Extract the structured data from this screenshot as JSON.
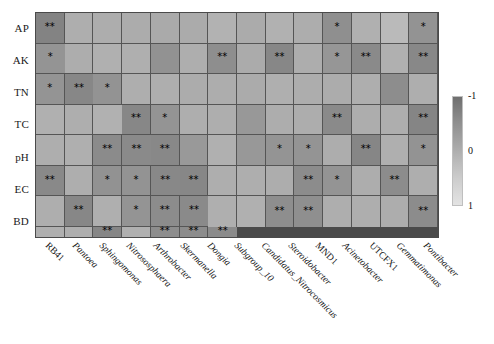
{
  "chart_data": {
    "type": "heatmap",
    "title": "",
    "xlabel": "",
    "ylabel": "",
    "legend_position": "right",
    "grid": true,
    "colorbar": {
      "name": "correlation-colorbar",
      "ticks": [
        "-1",
        "0",
        "1"
      ],
      "tick_values": [
        -1,
        0,
        1
      ],
      "vmin": -1,
      "vmax": 1,
      "colormap": "grayscale",
      "color_high": "#6f6f6f",
      "color_low": "#e3e3e3",
      "orientation": "vertical"
    },
    "significance_legend": {
      "one_star": "*",
      "two_star": "**"
    },
    "y_categories": [
      "AP",
      "AK",
      "TN",
      "TC",
      "pH",
      "EC",
      "BD"
    ],
    "x_categories": [
      "RB41",
      "Pantoea",
      "Sphingomonas",
      "Nitrososphaera",
      "Arthrobacter",
      "Skermanella",
      "Dongia",
      "Subgroup_10",
      "Candidatus_Nitrocosmicus",
      "Steroidobacter",
      "MND1",
      "Acinetobacter",
      "UTCFX1",
      "Gemmatimonas",
      "Pontibacter"
    ],
    "x_categories_used": [
      "RB41",
      "Pantoea",
      "Sphingomonas",
      "Nitrososphaera",
      "Arthrobacter",
      "Skermanella",
      "Dongia",
      "Subgroup_10",
      "Candidatus_Nitrocosmicus",
      "Steroidobacter",
      "MND1",
      "Acinetobacter",
      "UTCFX1",
      "Gemmatimonas",
      "Pontibacter"
    ],
    "rows": [
      {
        "label": "AP",
        "values": [
          -0.58,
          0.12,
          0.1,
          0.08,
          0.05,
          0.07,
          0.18,
          0.06,
          0.16,
          0.1,
          -0.38,
          0.14,
          0.3,
          -0.33,
          -0.3
        ],
        "stars": [
          "**",
          "",
          "",
          "",
          "",
          "",
          "",
          "",
          "",
          "",
          "*",
          "",
          "",
          "*",
          "*"
        ]
      },
      {
        "label": "AK",
        "values": [
          0.1,
          0.14,
          0.13,
          -0.34,
          0.12,
          -0.4,
          0.07,
          -0.52,
          0.1,
          -0.28,
          -0.47,
          0.15,
          -0.5,
          -0.31,
          -0.52
        ],
        "stars": [
          "",
          "",
          "",
          "",
          "",
          "**",
          "",
          "**",
          "",
          "*",
          "**",
          "",
          "**",
          "*",
          "**"
        ]
      },
      {
        "label": "TN",
        "values": [
          -0.33,
          0.12,
          0.11,
          0.08,
          0.1,
          0.06,
          0.13,
          0.09,
          0.08,
          0.12,
          -0.42,
          0.11,
          0.14,
          0.12,
          0.16
        ],
        "stars": [
          "*",
          "",
          "",
          "",
          "",
          "",
          "",
          "",
          "",
          "",
          "",
          "",
          "",
          "",
          ""
        ]
      },
      {
        "label": "TC",
        "values": [
          -0.52,
          -0.3,
          0.12,
          0.11,
          -0.25,
          0.09,
          0.1,
          -0.46,
          0.1,
          0.12,
          -0.55,
          0.11,
          0.13,
          -0.45,
          -0.47
        ],
        "stars": [
          "**",
          "*",
          "",
          "",
          "",
          "",
          "",
          "**",
          "",
          "",
          "**",
          "",
          "",
          "**",
          "**"
        ]
      },
      {
        "label": "pH",
        "values": [
          -0.5,
          -0.22,
          0.14,
          -0.24,
          -0.3,
          -0.31,
          0.1,
          -0.54,
          0.13,
          -0.33,
          -0.49,
          0.12,
          -0.34,
          -0.32,
          -0.5
        ],
        "stars": [
          "**",
          "",
          "",
          "",
          "*",
          "*",
          "",
          "**",
          "",
          "*",
          "**",
          "",
          "*",
          "*",
          "**"
        ]
      },
      {
        "label": "EC",
        "values": [
          -0.51,
          0.11,
          0.12,
          0.1,
          -0.44,
          -0.31,
          0.1,
          -0.43,
          0.12,
          0.12,
          -0.52,
          0.13,
          -0.3,
          -0.43,
          -0.46
        ],
        "stars": [
          "**",
          "",
          "",
          "",
          "**",
          "*",
          "",
          "**",
          "",
          "",
          "**",
          "",
          "*",
          "**",
          "**"
        ]
      },
      {
        "label": "BD",
        "values": [
          0.13,
          0.14,
          -0.41,
          -0.38,
          0.11,
          0.12,
          0.1,
          -0.44,
          0.13,
          0.11,
          -0.53,
          0.15,
          -0.42,
          -0.43,
          -0.45
        ],
        "stars": [
          "",
          "",
          "**",
          "**",
          "",
          "",
          "",
          "**",
          "",
          "",
          "**",
          "",
          "**",
          "**",
          "**"
        ]
      }
    ]
  }
}
